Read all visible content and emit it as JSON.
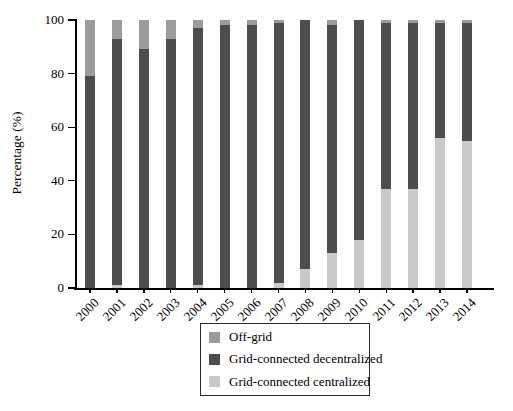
{
  "chart_data": {
    "type": "bar",
    "stacked": true,
    "orientation": "vertical",
    "title": "",
    "xlabel": "",
    "ylabel": "Percentage (%)",
    "ylim": [
      0,
      100
    ],
    "yticks": [
      0,
      20,
      40,
      60,
      80,
      100
    ],
    "grid": false,
    "categories": [
      "2000",
      "2001",
      "2002",
      "2003",
      "2004",
      "2005",
      "2006",
      "2007",
      "2008",
      "2009",
      "2010",
      "2011",
      "2012",
      "2013",
      "2014"
    ],
    "series": [
      {
        "name": "Grid-connected centralized",
        "color": "#c9c9c9",
        "values": [
          0,
          1,
          0,
          0,
          1,
          0,
          0,
          2,
          7,
          13,
          18,
          37,
          37,
          56,
          55
        ]
      },
      {
        "name": "Grid-connected decentralized",
        "color": "#4d4d4d",
        "values": [
          79,
          92,
          89,
          93,
          96,
          98,
          98,
          97,
          93,
          85,
          82,
          62,
          62,
          43,
          44
        ]
      },
      {
        "name": "Off-grid",
        "color": "#9b9b9b",
        "values": [
          21,
          7,
          11,
          7,
          3,
          2,
          2,
          1,
          0,
          2,
          0,
          1,
          1,
          1,
          1
        ]
      }
    ],
    "legend": {
      "position": "bottom-center",
      "border": true,
      "items": [
        {
          "label": "Off-grid",
          "color": "#9b9b9b"
        },
        {
          "label": "Grid-connected decentralized",
          "color": "#4d4d4d"
        },
        {
          "label": "Grid-connected centralized",
          "color": "#c9c9c9"
        }
      ]
    }
  }
}
